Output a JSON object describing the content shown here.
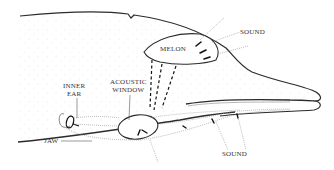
{
  "diagram": {
    "labels": {
      "melon": "MELON",
      "sound_top": "SOUND",
      "sound_bottom": "SOUND",
      "acoustic_window_line1": "ACOUSTIC",
      "acoustic_window_line2": "WINDOW",
      "inner_ear_line1": "INNER",
      "inner_ear_line2": "EAR",
      "jaw": "JAW"
    },
    "colors": {
      "outline": "#2b2b2b",
      "dotted": "#8a8a8a",
      "stipple": "#c8c8c8",
      "text": "#333333"
    }
  }
}
